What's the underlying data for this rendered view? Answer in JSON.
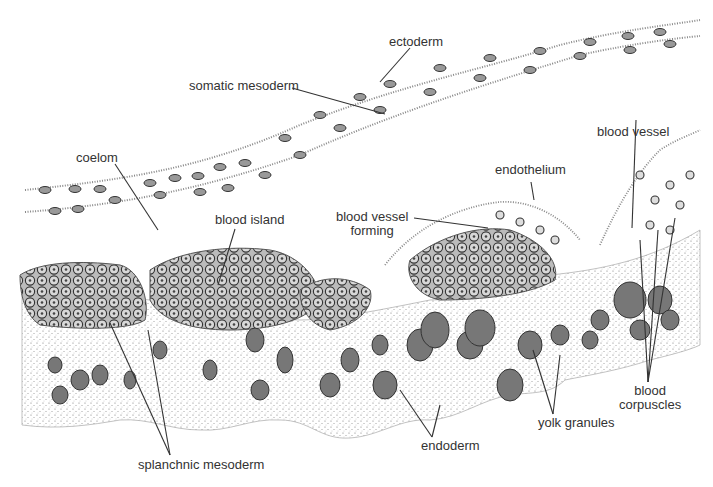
{
  "figure": {
    "type": "anatomical illustration",
    "labels": {
      "ectoderm": "ectoderm",
      "somatic_mesoderm": "somatic mesoderm",
      "coelom": "coelom",
      "blood_vessel": "blood vessel",
      "endothelium": "endothelium",
      "blood_island": "blood island",
      "blood_vessel_forming_1": "blood vessel",
      "blood_vessel_forming_2": "forming",
      "splanchnic_mesoderm": "splanchnic mesoderm",
      "endoderm": "endoderm",
      "yolk_granules": "yolk granules",
      "blood_corpuscles_1": "blood",
      "blood_corpuscles_2": "corpuscles"
    },
    "colors": {
      "ink": "#333333",
      "cell_fill": "#8a8a8a",
      "stipple": "#777777",
      "background": "#ffffff"
    }
  }
}
